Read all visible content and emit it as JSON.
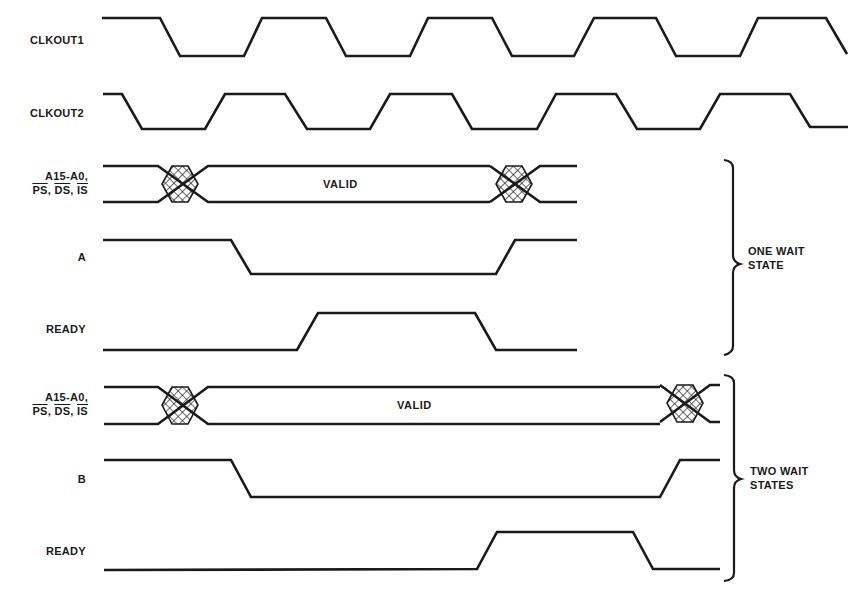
{
  "diagram": {
    "type": "timing-diagram",
    "signals": {
      "clkout1": {
        "label": "CLKOUT1"
      },
      "clkout2": {
        "label": "CLKOUT2"
      },
      "bus1": {
        "label_line1": "A15-A0,",
        "label_line2_parts": [
          "PS",
          "DS",
          "IS"
        ],
        "state_text": "VALID"
      },
      "a": {
        "label": "A"
      },
      "ready1": {
        "label": "READY"
      },
      "bus2": {
        "label_line1": "A15-A0,",
        "label_line2_parts": [
          "PS",
          "DS",
          "IS"
        ],
        "state_text": "VALID"
      },
      "b": {
        "label": "B"
      },
      "ready2": {
        "label": "READY"
      }
    },
    "groups": {
      "one_wait": {
        "line1": "ONE WAIT",
        "line2": "STATE"
      },
      "two_wait": {
        "line1": "TWO WAIT",
        "line2": "STATES"
      }
    },
    "separator": ", "
  }
}
